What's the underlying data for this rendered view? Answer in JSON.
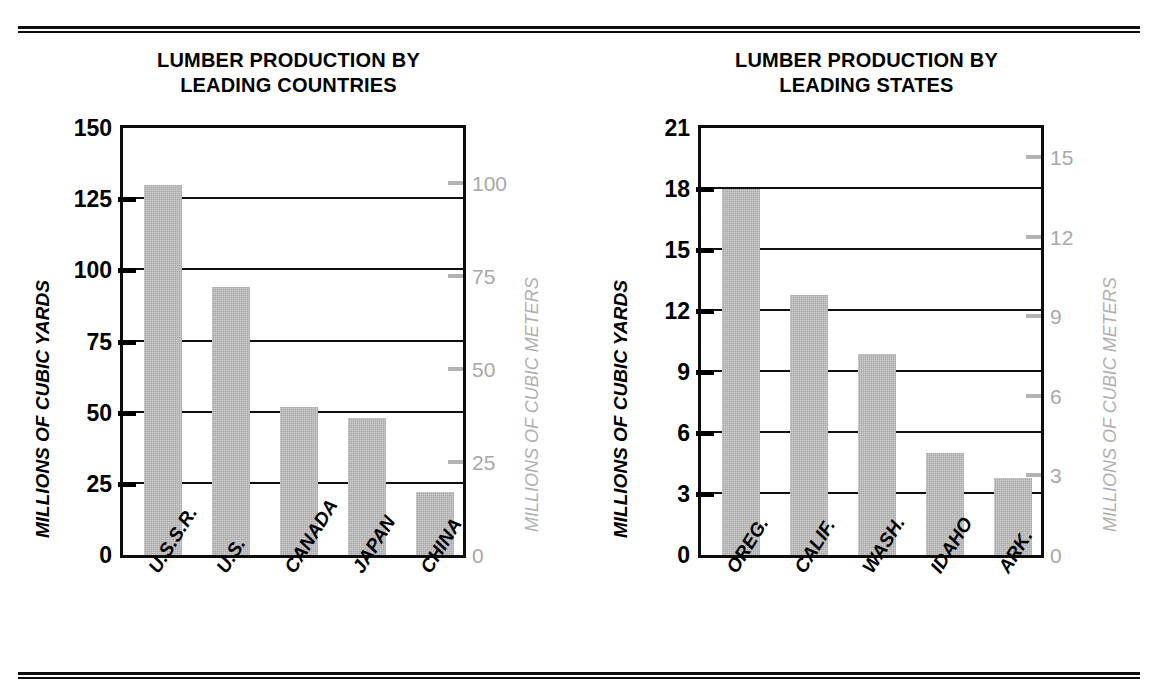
{
  "figure": {
    "rules": {
      "top_label": "top-double-rule",
      "bottom_label": "bottom-double-rule"
    }
  },
  "charts": [
    {
      "id": "countries",
      "title": "LUMBER PRODUCTION BY\nLEADING COUNTRIES",
      "title_line1": "LUMBER PRODUCTION BY",
      "title_line2": "LEADING COUNTRIES",
      "ylabel_left": "MILLIONS OF CUBIC YARDS",
      "ylabel_right": "MILLIONS OF CUBIC METERS",
      "yticks_left": [
        "0",
        "25",
        "50",
        "75",
        "100",
        "125",
        "150"
      ],
      "yticks_right": [
        "0",
        "25",
        "50",
        "75",
        "100"
      ],
      "categories": [
        "U.S.S.R.",
        "U.S.",
        "CANADA",
        "JAPAN",
        "CHINA"
      ],
      "values": [
        130,
        94,
        52,
        48,
        22
      ]
    },
    {
      "id": "states",
      "title": "LUMBER PRODUCTION BY\nLEADING STATES",
      "title_line1": "LUMBER PRODUCTION BY",
      "title_line2": "LEADING STATES",
      "ylabel_left": "MILLIONS OF CUBIC YARDS",
      "ylabel_right": "MILLIONS OF CUBIC METERS",
      "yticks_left": [
        "0",
        "3",
        "6",
        "9",
        "12",
        "15",
        "18",
        "21"
      ],
      "yticks_right": [
        "0",
        "3",
        "6",
        "9",
        "12",
        "15"
      ],
      "categories": [
        "OREG.",
        "CALIF.",
        "WASH.",
        "IDAHO",
        "ARK."
      ],
      "values": [
        18.0,
        12.8,
        9.9,
        5.0,
        3.8
      ]
    }
  ],
  "chart_data": [
    {
      "type": "bar",
      "title": "LUMBER PRODUCTION BY LEADING COUNTRIES",
      "categories": [
        "U.S.S.R.",
        "U.S.",
        "CANADA",
        "JAPAN",
        "CHINA"
      ],
      "values": [
        130,
        94,
        52,
        48,
        22
      ],
      "xlabel": "",
      "ylabel": "MILLIONS OF CUBIC YARDS",
      "ylabel_secondary": "MILLIONS OF CUBIC METERS",
      "ylim": [
        0,
        150
      ],
      "ylim_secondary": [
        0,
        114.8
      ],
      "yticks": [
        0,
        25,
        50,
        75,
        100,
        125,
        150
      ],
      "yticks_secondary": [
        0,
        25,
        50,
        75,
        100
      ],
      "grid": true,
      "legend": "none",
      "bar_color": "#a9a9a9",
      "axis_color": "#0d0d0d",
      "secondary_axis_color": "#b0b0b0"
    },
    {
      "type": "bar",
      "title": "LUMBER PRODUCTION BY LEADING STATES",
      "categories": [
        "OREG.",
        "CALIF.",
        "WASH.",
        "IDAHO",
        "ARK."
      ],
      "values": [
        18.0,
        12.8,
        9.9,
        5.0,
        3.8
      ],
      "xlabel": "",
      "ylabel": "MILLIONS OF CUBIC YARDS",
      "ylabel_secondary": "MILLIONS OF CUBIC METERS",
      "ylim": [
        0,
        21
      ],
      "ylim_secondary": [
        0,
        16.1
      ],
      "yticks": [
        0,
        3,
        6,
        9,
        12,
        15,
        18,
        21
      ],
      "yticks_secondary": [
        0,
        3,
        6,
        9,
        12,
        15
      ],
      "grid": true,
      "legend": "none",
      "bar_color": "#a9a9a9",
      "axis_color": "#0d0d0d",
      "secondary_axis_color": "#b0b0b0"
    }
  ]
}
